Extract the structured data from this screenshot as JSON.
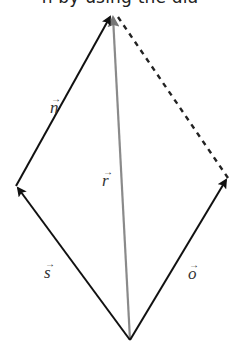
{
  "caption": "n by using the dia",
  "diagram": {
    "type": "vector-parallelogram",
    "vertices": {
      "bottom": [
        130,
        340
      ],
      "left": [
        16,
        186
      ],
      "top": [
        113,
        14
      ],
      "right": [
        228,
        178
      ]
    },
    "vectors": [
      {
        "name": "s",
        "label": "s",
        "from": "bottom",
        "to": "left",
        "style": "solid",
        "color": "#111111"
      },
      {
        "name": "n",
        "label": "n",
        "from": "left",
        "to": "top",
        "style": "solid",
        "color": "#111111"
      },
      {
        "name": "o",
        "label": "o",
        "from": "bottom",
        "to": "right",
        "style": "solid",
        "color": "#111111"
      },
      {
        "name": "r",
        "label": "r",
        "from": "bottom",
        "to": "top",
        "style": "solid",
        "color": "#888888"
      },
      {
        "name": "closing",
        "label": "",
        "from": "top",
        "to": "right",
        "style": "dashed",
        "color": "#222222"
      }
    ],
    "labels": {
      "n": "n",
      "r": "r",
      "s": "s",
      "o": "o",
      "arrow": "→"
    }
  }
}
